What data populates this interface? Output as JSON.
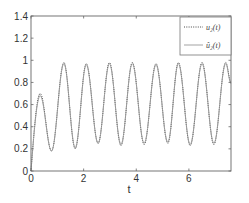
{
  "chart_data": {
    "type": "line",
    "title": "",
    "xlabel": "t",
    "ylabel": "",
    "xlim": [
      0,
      7.6
    ],
    "ylim": [
      0,
      1.4
    ],
    "xticks": [
      0,
      2,
      4,
      6
    ],
    "xtick_labels": [
      "0",
      "2",
      "4",
      "6"
    ],
    "yticks": [
      0,
      0.2,
      0.4,
      0.6,
      0.8,
      1,
      1.2,
      1.4
    ],
    "ytick_labels": [
      "0",
      "0.2",
      "0.4",
      "0.6",
      "0.8",
      "1",
      "1.2",
      "1.4"
    ],
    "grid": false,
    "legend_position": "upper right",
    "x": [
      0,
      0.35,
      0.78,
      1.25,
      1.68,
      2.1,
      2.55,
      2.98,
      3.42,
      3.85,
      4.3,
      4.75,
      5.2,
      5.6,
      6.05,
      6.5,
      6.95,
      7.4,
      7.6
    ],
    "series": [
      {
        "name": "u2(t)",
        "style": "dotted",
        "color": "#333333",
        "values": [
          0.0,
          0.7,
          0.18,
          0.98,
          0.2,
          0.97,
          0.25,
          0.98,
          0.23,
          0.98,
          0.24,
          0.97,
          0.25,
          0.98,
          0.23,
          0.98,
          0.24,
          0.98,
          0.8
        ]
      },
      {
        "name": "û2(t)",
        "style": "solid",
        "color": "#999999",
        "values": [
          0.0,
          0.68,
          0.18,
          0.97,
          0.21,
          0.96,
          0.25,
          0.97,
          0.24,
          0.97,
          0.25,
          0.96,
          0.26,
          0.97,
          0.24,
          0.97,
          0.25,
          0.97,
          0.79
        ]
      }
    ]
  },
  "legend": {
    "items": [
      {
        "label": "u₂(t)",
        "style": "dotted"
      },
      {
        "label": "û₂(t)",
        "style": "solid"
      }
    ]
  },
  "axes": {
    "xlabel": "t"
  }
}
